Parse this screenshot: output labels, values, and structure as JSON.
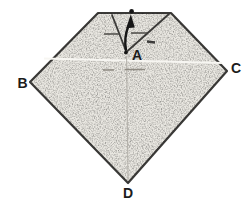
{
  "figure": {
    "vertex_labels": {
      "a": "A",
      "b": "B",
      "c": "C",
      "d": "D"
    },
    "arrow": {
      "direction": "up"
    },
    "colors": {
      "background": "#ffffff",
      "paper": "#e9e7e1",
      "outline": "#3b3a38",
      "ink": "#161616",
      "label": "#1c1c1c",
      "fold_dash": "#4c4b47",
      "crease_dash": "#8f8b83",
      "crease_light": "#f7f6f2",
      "crease_vertical": "#b3b0a9"
    }
  }
}
